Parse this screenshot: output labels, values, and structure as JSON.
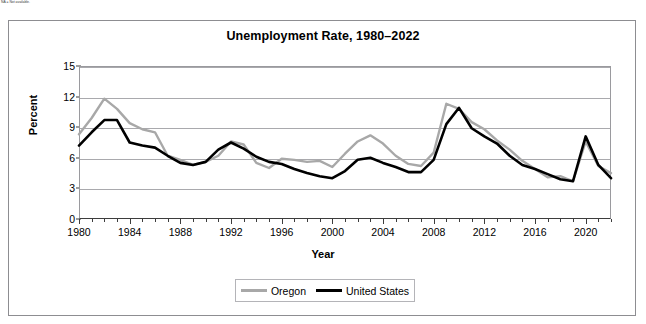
{
  "footnote_top": "NA = Not available.",
  "chart_data": {
    "type": "line",
    "title": "Unemployment Rate, 1980–2022",
    "xlabel": "Year",
    "ylabel": "Percent",
    "xlim": [
      1980,
      2022
    ],
    "ylim": [
      0,
      15
    ],
    "yticks": [
      0,
      3,
      6,
      9,
      12,
      15
    ],
    "xticks": [
      1980,
      1984,
      1988,
      1992,
      1996,
      2000,
      2004,
      2008,
      2012,
      2016,
      2020
    ],
    "xtick_minor_step": 1,
    "grid": "horizontal",
    "legend_position": "bottom-center",
    "x": [
      1980,
      1981,
      1982,
      1983,
      1984,
      1985,
      1986,
      1987,
      1988,
      1989,
      1990,
      1991,
      1992,
      1993,
      1994,
      1995,
      1996,
      1997,
      1998,
      1999,
      2000,
      2001,
      2002,
      2003,
      2004,
      2005,
      2006,
      2007,
      2008,
      2009,
      2010,
      2011,
      2012,
      2013,
      2014,
      2015,
      2016,
      2017,
      2018,
      2019,
      2020,
      2021,
      2022
    ],
    "series": [
      {
        "name": "Oregon",
        "color": "#a8a8a8",
        "values": [
          8.3,
          9.9,
          11.8,
          10.8,
          9.4,
          8.8,
          8.5,
          6.2,
          5.8,
          5.3,
          5.6,
          6.2,
          7.6,
          7.3,
          5.5,
          5.0,
          5.9,
          5.8,
          5.6,
          5.7,
          5.1,
          6.4,
          7.6,
          8.2,
          7.4,
          6.2,
          5.4,
          5.2,
          6.5,
          11.3,
          10.8,
          9.5,
          8.8,
          7.7,
          6.8,
          5.7,
          4.9,
          4.1,
          4.2,
          3.7,
          7.6,
          5.2,
          4.5
        ]
      },
      {
        "name": "United States",
        "color": "#000000",
        "values": [
          7.2,
          8.5,
          9.7,
          9.7,
          7.5,
          7.2,
          7.0,
          6.2,
          5.5,
          5.3,
          5.6,
          6.8,
          7.5,
          6.9,
          6.1,
          5.6,
          5.4,
          4.9,
          4.5,
          4.2,
          4.0,
          4.7,
          5.8,
          6.0,
          5.5,
          5.1,
          4.6,
          4.6,
          5.8,
          9.3,
          10.9,
          8.9,
          8.1,
          7.4,
          6.2,
          5.3,
          4.9,
          4.4,
          3.9,
          3.7,
          8.1,
          5.3,
          4.0
        ]
      }
    ]
  },
  "legend": {
    "entries": [
      {
        "label": "Oregon"
      },
      {
        "label": "United States"
      }
    ]
  }
}
